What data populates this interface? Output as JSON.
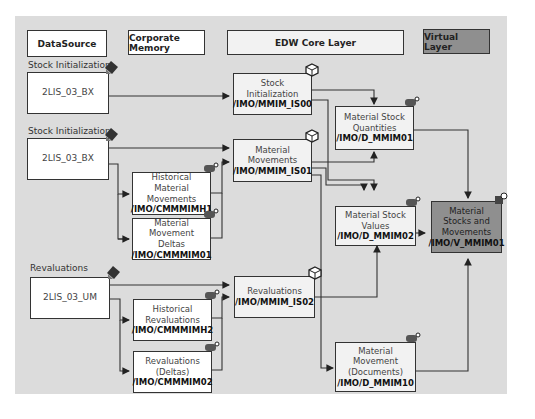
{
  "headers": {
    "datasource": "DataSource",
    "corporate_memory": "Corporate Memory",
    "edw_core": "EDW Core Layer",
    "virtual": "Virtual Layer"
  },
  "groups": {
    "stock_init_1": "Stock Initialization",
    "stock_init_2": "Stock Initialization",
    "revaluations": "Revaluations"
  },
  "datasources": {
    "bx1": "2LIS_03_BX",
    "bx2": "2LIS_03_BX",
    "um": "2LIS_03_UM"
  },
  "corporate_memory": {
    "hist_mat_mov": {
      "label1": "Historical Material",
      "label2": "Movements",
      "tech": "/IMO/CMMMIMH1"
    },
    "mat_mov_deltas": {
      "label1": "Material Movement",
      "label2": "Deltas",
      "tech": "/IMO/CMMMIM01"
    },
    "hist_reval": {
      "label1": "Historical",
      "label2": "Revaluations",
      "tech": "/IMO/CMMMIMH2"
    },
    "reval_deltas": {
      "label1": "Revaluations",
      "label2": "(Deltas)",
      "tech": "/IMO/CMMMIM02"
    }
  },
  "infosources": {
    "is00": {
      "label1": "Stock Initialization",
      "tech": "/IMO/MMIM_IS00"
    },
    "is01": {
      "label1": "Material",
      "label2": "Movements",
      "tech": "/IMO/MMIM_IS01"
    },
    "is02": {
      "label1": "Revaluations",
      "tech": "/IMO/MMIM_IS02"
    }
  },
  "dso": {
    "mmim01": {
      "label1": "Material Stock",
      "label2": "Quantities",
      "tech": "/IMO/D_MMIM01"
    },
    "mmim02": {
      "label1": "Material Stock",
      "label2": "Values",
      "tech": "/IMO/D_MMIM02"
    },
    "mmim10": {
      "label1": "Material",
      "label2": "Movement",
      "label3": "(Documents)",
      "tech": "/IMO/D_MMIM10"
    }
  },
  "virtual": {
    "v_mmim01": {
      "label1": "Material",
      "label2": "Stocks and",
      "label3": "Movements",
      "tech": "/IMO/V_MMIM01"
    }
  },
  "colors": {
    "panel": "#dcdcdc",
    "virtual_box": "#8f8f8f",
    "edw_box": "#f2f2f2",
    "line": "#333333"
  }
}
